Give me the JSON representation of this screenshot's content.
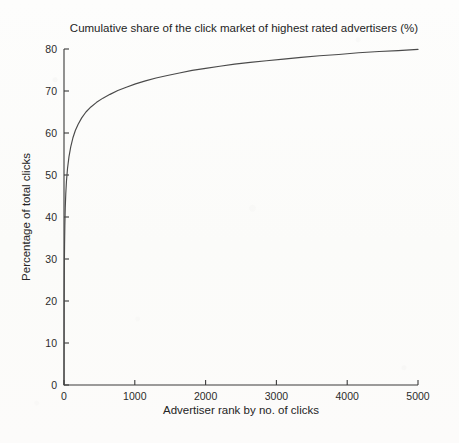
{
  "chart_data": {
    "type": "line",
    "title": "Cumulative share of the click market of highest rated advertisers (%)",
    "xlabel": "Advertiser rank by no. of clicks",
    "ylabel": "Percentage of total clicks",
    "xlim": [
      0,
      5000
    ],
    "ylim": [
      0,
      80
    ],
    "xticks": [
      0,
      1000,
      2000,
      3000,
      4000,
      5000
    ],
    "yticks": [
      0,
      10,
      20,
      30,
      40,
      50,
      60,
      70,
      80
    ],
    "xtick_labels": [
      "0",
      "1000",
      "2000",
      "3000",
      "4000",
      "5000"
    ],
    "ytick_labels": [
      "0",
      "10",
      "20",
      "30",
      "40",
      "50",
      "60",
      "70",
      "80"
    ],
    "grid": false,
    "legend": null,
    "line_color": "#4a4a4a",
    "series": [
      {
        "name": "Cumulative click share",
        "x": [
          0,
          2,
          5,
          8,
          12,
          18,
          25,
          35,
          50,
          70,
          95,
          125,
          160,
          200,
          250,
          310,
          380,
          460,
          550,
          650,
          760,
          880,
          1010,
          1150,
          1300,
          1460,
          1630,
          1810,
          2000,
          2200,
          2410,
          2630,
          2860,
          3100,
          3350,
          3610,
          3880,
          4160,
          4450,
          4720,
          5000
        ],
        "y": [
          0,
          18.5,
          28.0,
          33.5,
          38.0,
          42.3,
          45.5,
          48.6,
          51.6,
          54.3,
          56.7,
          58.8,
          60.6,
          62.1,
          63.6,
          65.0,
          66.2,
          67.3,
          68.3,
          69.2,
          70.1,
          70.9,
          71.7,
          72.4,
          73.1,
          73.7,
          74.3,
          74.9,
          75.4,
          75.9,
          76.4,
          76.8,
          77.2,
          77.6,
          78.0,
          78.4,
          78.7,
          79.1,
          79.4,
          79.6,
          79.9
        ]
      }
    ]
  },
  "axes": {
    "title": "Cumulative share of the click market of highest rated advertisers (%)",
    "xlabel": "Advertiser rank by no. of clicks",
    "ylabel": "Percentage of total clicks"
  }
}
